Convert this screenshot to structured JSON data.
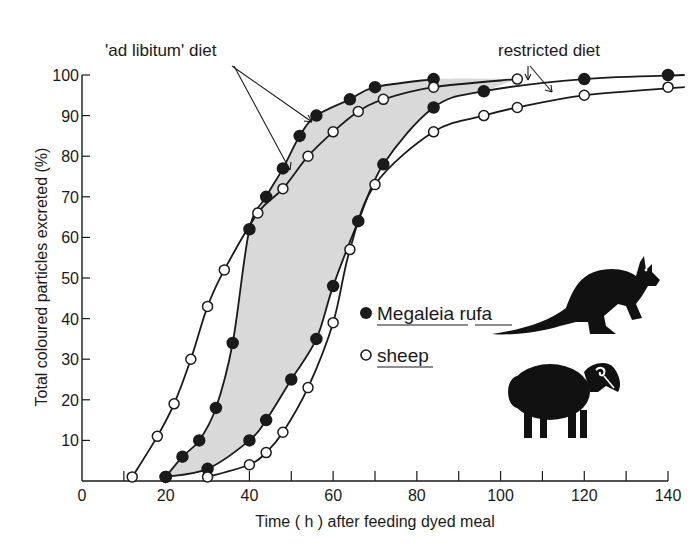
{
  "chart_data": {
    "type": "line",
    "title": "",
    "xlabel": "Time ( h ) after feeding dyed meal",
    "ylabel": "Total coloured particles excreted (%)",
    "xlim": [
      0,
      140
    ],
    "ylim": [
      0,
      100
    ],
    "x_ticks": [
      0,
      20,
      40,
      60,
      80,
      100,
      120,
      140
    ],
    "x_minor_ticks": [
      10,
      30,
      50,
      70,
      90,
      110,
      130
    ],
    "y_ticks": [
      10,
      20,
      30,
      40,
      50,
      60,
      70,
      80,
      90,
      100
    ],
    "grid": false,
    "legend": [
      {
        "label": "Megaleia rufa",
        "marker": "filled-circle"
      },
      {
        "label": "sheep",
        "marker": "open-circle"
      }
    ],
    "annotations": [
      {
        "text": "'ad libitum' diet",
        "points_to": [
          "Megaleia rufa ad libitum",
          "sheep ad libitum"
        ]
      },
      {
        "text": "restricted diet",
        "points_to": [
          "Megaleia rufa restricted",
          "sheep restricted"
        ]
      }
    ],
    "shaded_region": "area between Megaleia rufa ad libitum curve and Megaleia rufa restricted curve (light grey)",
    "series": [
      {
        "name": "Megaleia rufa ad libitum",
        "marker": "filled",
        "points": [
          [
            20,
            1
          ],
          [
            24,
            6
          ],
          [
            28,
            10
          ],
          [
            32,
            18
          ],
          [
            36,
            34
          ],
          [
            40,
            62
          ],
          [
            44,
            70
          ],
          [
            48,
            77
          ],
          [
            52,
            85
          ],
          [
            56,
            90
          ],
          [
            64,
            94
          ],
          [
            70,
            97
          ],
          [
            84,
            99
          ]
        ]
      },
      {
        "name": "sheep ad libitum",
        "marker": "open",
        "points": [
          [
            12,
            1
          ],
          [
            18,
            11
          ],
          [
            22,
            19
          ],
          [
            26,
            30
          ],
          [
            30,
            43
          ],
          [
            34,
            52
          ],
          [
            42,
            66
          ],
          [
            48,
            72
          ],
          [
            54,
            80
          ],
          [
            60,
            86
          ],
          [
            66,
            91
          ],
          [
            72,
            94
          ],
          [
            84,
            97
          ],
          [
            104,
            99
          ]
        ]
      },
      {
        "name": "Megaleia rufa restricted",
        "marker": "filled",
        "points": [
          [
            20,
            1
          ],
          [
            30,
            3
          ],
          [
            40,
            10
          ],
          [
            44,
            15
          ],
          [
            50,
            25
          ],
          [
            56,
            35
          ],
          [
            60,
            48
          ],
          [
            66,
            64
          ],
          [
            72,
            78
          ],
          [
            84,
            92
          ],
          [
            96,
            96
          ],
          [
            120,
            99
          ],
          [
            144,
            100
          ]
        ]
      },
      {
        "name": "sheep restricted",
        "marker": "open",
        "points": [
          [
            30,
            1
          ],
          [
            40,
            4
          ],
          [
            44,
            7
          ],
          [
            48,
            12
          ],
          [
            54,
            23
          ],
          [
            60,
            39
          ],
          [
            64,
            57
          ],
          [
            70,
            73
          ],
          [
            84,
            86
          ],
          [
            96,
            90
          ],
          [
            104,
            92
          ],
          [
            120,
            95
          ],
          [
            144,
            97
          ]
        ]
      }
    ]
  },
  "labels": {
    "ad_libitum": "'ad libitum' diet",
    "restricted": "restricted diet",
    "legend_kangaroo": "Megaleia rufa",
    "legend_sheep": "sheep",
    "xlabel": "Time ( h ) after feeding dyed meal",
    "ylabel": "Total coloured particles excreted (%)"
  },
  "colors": {
    "ink": "#1a1a1a",
    "shade": "#d9d9d9",
    "background": "#ffffff"
  }
}
